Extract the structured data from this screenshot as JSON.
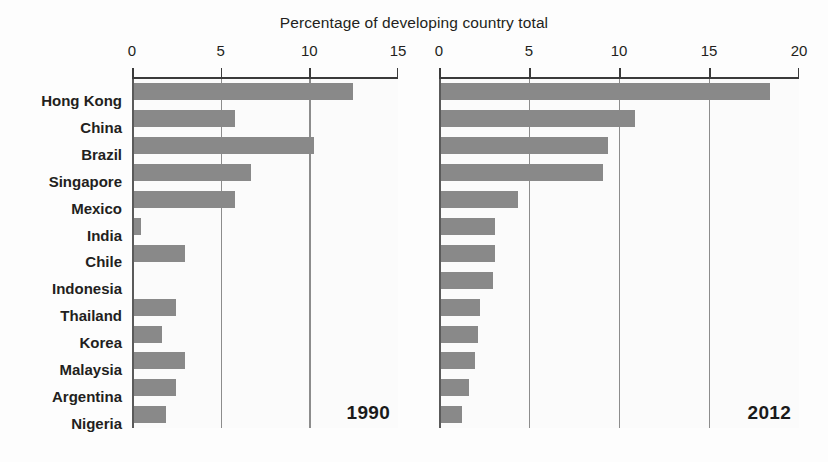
{
  "chart_data": {
    "type": "bar",
    "orientation": "horizontal",
    "title": "Percentage of developing country total",
    "xlabel": "",
    "ylabel": "",
    "grid": true,
    "legend": "none",
    "categories": [
      "Hong Kong",
      "China",
      "Brazil",
      "Singapore",
      "Mexico",
      "India",
      "Chile",
      "Indonesia",
      "Thailand",
      "Korea",
      "Malaysia",
      "Argentina",
      "Nigeria"
    ],
    "panels": [
      {
        "name": "1990",
        "year_label": "1990",
        "xlim": [
          0,
          15
        ],
        "xticks": [
          0,
          5,
          10,
          15
        ],
        "xtick_labels": [
          "0",
          "5",
          "10",
          "15"
        ],
        "values": [
          12.4,
          5.7,
          10.2,
          6.6,
          5.7,
          0.4,
          2.9,
          0.0,
          2.4,
          1.6,
          2.9,
          2.4,
          1.8
        ]
      },
      {
        "name": "2012",
        "year_label": "2012",
        "xlim": [
          0,
          20
        ],
        "xticks": [
          0,
          5,
          10,
          15,
          20
        ],
        "xtick_labels": [
          "0",
          "5",
          "10",
          "15",
          "20"
        ],
        "values": [
          18.3,
          10.8,
          9.3,
          9.0,
          4.3,
          3.0,
          3.0,
          2.9,
          2.2,
          2.1,
          1.9,
          1.6,
          1.2
        ]
      }
    ],
    "series": [
      {
        "name": "1990",
        "values": [
          12.4,
          5.7,
          10.2,
          6.6,
          5.7,
          0.4,
          2.9,
          0.0,
          2.4,
          1.6,
          2.9,
          2.4,
          1.8
        ]
      },
      {
        "name": "2012",
        "values": [
          18.3,
          10.8,
          9.3,
          9.0,
          4.3,
          3.0,
          3.0,
          2.9,
          2.2,
          2.1,
          1.9,
          1.6,
          1.2
        ]
      }
    ],
    "colors": {
      "bar": "#898989",
      "axis": "#3a3a3a",
      "grid": "#8c8c8c",
      "text": "#231f20",
      "background": "#fbfbfb"
    }
  }
}
